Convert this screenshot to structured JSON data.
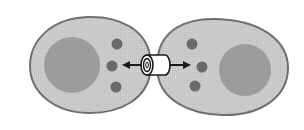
{
  "diagram": {
    "title": "",
    "colors": {
      "background": "#ffffff",
      "cytoplasm": "#c9c9c9",
      "membrane": "#6e6e6e",
      "nucleus": "#9a9a9a",
      "vesicle": "#6a6a6a",
      "channel_fill": "#ffffff",
      "channel_stroke": "#1a1a1a",
      "arrow": "#1a1a1a"
    },
    "cells": [
      {
        "name": "left-cell",
        "nucleus": true,
        "vesicles": 3
      },
      {
        "name": "right-cell",
        "nucleus": true,
        "vesicles": 3
      }
    ],
    "channel": {
      "name": "gap-junction-connexon"
    },
    "arrows": [
      {
        "direction": "left"
      },
      {
        "direction": "right"
      }
    ]
  }
}
